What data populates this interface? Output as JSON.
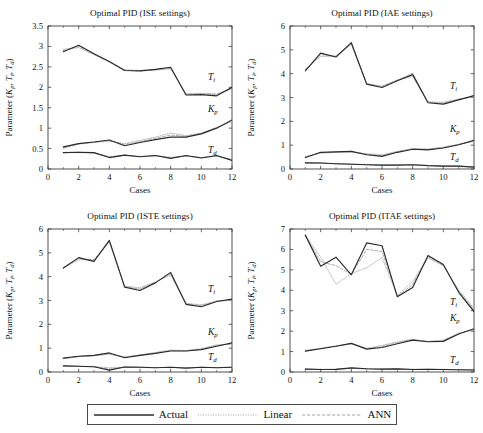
{
  "figure": {
    "legend": {
      "entries": [
        {
          "label": "Actual",
          "style": "solid",
          "color": "#2b2b2b"
        },
        {
          "label": "Linear",
          "style": "dotted",
          "color": "#9a9a9a"
        },
        {
          "label": "ANN",
          "style": "dashed",
          "color": "#9a9a9a"
        }
      ]
    },
    "axis_label_x": "Cases",
    "axis_label_y": "Parameter (Kₚ, Tᵢ, T_d)",
    "curve_labels": {
      "ti": "T",
      "ti_sub": "i",
      "kp": "K",
      "kp_sub": "p",
      "td": "T",
      "td_sub": "d"
    }
  },
  "chart_data": [
    {
      "id": "ise",
      "type": "line",
      "title": "Optimal PID (ISE settings)",
      "xlabel": "Cases",
      "ylabel": "Parameter (Kp, Ti, Td)",
      "x": [
        1,
        2,
        3,
        4,
        5,
        6,
        7,
        8,
        9,
        10,
        11,
        12
      ],
      "xlim": [
        0,
        12
      ],
      "ylim": [
        0,
        3.5
      ],
      "xticks": [
        0,
        2,
        4,
        6,
        8,
        10,
        12
      ],
      "yticks": [
        0,
        0.5,
        1,
        1.5,
        2,
        2.5,
        3,
        3.5
      ],
      "grid": false,
      "legend_position": "below-figure",
      "series": [
        {
          "name": "Ti Actual",
          "param": "Ti",
          "model": "Actual",
          "values": [
            2.87,
            3.03,
            2.82,
            2.63,
            2.41,
            2.4,
            2.44,
            2.49,
            1.81,
            1.82,
            1.79,
            2.0
          ]
        },
        {
          "name": "Ti Linear",
          "param": "Ti",
          "model": "Linear",
          "values": [
            2.93,
            2.97,
            2.8,
            2.62,
            2.43,
            2.41,
            2.43,
            2.45,
            1.84,
            1.85,
            1.84,
            1.96
          ]
        },
        {
          "name": "Ti ANN",
          "param": "Ti",
          "model": "ANN",
          "values": [
            2.9,
            3.0,
            2.81,
            2.62,
            2.42,
            2.4,
            2.42,
            2.47,
            1.83,
            1.84,
            1.82,
            1.98
          ]
        },
        {
          "name": "Kp Actual",
          "param": "Kp",
          "model": "Actual",
          "values": [
            0.54,
            0.62,
            0.66,
            0.71,
            0.57,
            0.65,
            0.72,
            0.78,
            0.78,
            0.86,
            1.0,
            1.2
          ]
        },
        {
          "name": "Kp Linear",
          "param": "Kp",
          "model": "Linear",
          "values": [
            0.5,
            0.61,
            0.65,
            0.68,
            0.62,
            0.7,
            0.78,
            0.88,
            0.82,
            0.88,
            1.02,
            1.16
          ]
        },
        {
          "name": "Kp ANN",
          "param": "Kp",
          "model": "ANN",
          "values": [
            0.52,
            0.62,
            0.66,
            0.7,
            0.6,
            0.67,
            0.75,
            0.83,
            0.8,
            0.87,
            1.01,
            1.18
          ]
        },
        {
          "name": "Td Actual",
          "param": "Td",
          "model": "Actual",
          "values": [
            0.4,
            0.41,
            0.4,
            0.28,
            0.34,
            0.3,
            0.33,
            0.26,
            0.33,
            0.27,
            0.33,
            0.21
          ]
        },
        {
          "name": "Td Linear",
          "param": "Td",
          "model": "Linear",
          "values": [
            0.4,
            0.4,
            0.39,
            0.31,
            0.33,
            0.31,
            0.32,
            0.29,
            0.31,
            0.28,
            0.31,
            0.24
          ]
        },
        {
          "name": "Td ANN",
          "param": "Td",
          "model": "ANN",
          "values": [
            0.4,
            0.41,
            0.39,
            0.29,
            0.34,
            0.3,
            0.33,
            0.27,
            0.32,
            0.28,
            0.32,
            0.22
          ]
        }
      ]
    },
    {
      "id": "iae",
      "type": "line",
      "title": "Optimal PID (IAE settings)",
      "xlabel": "Cases",
      "ylabel": "Parameter (Kp, Ti, Td)",
      "x": [
        1,
        2,
        3,
        4,
        5,
        6,
        7,
        8,
        9,
        10,
        11,
        12
      ],
      "xlim": [
        0,
        12
      ],
      "ylim": [
        0,
        6
      ],
      "xticks": [
        0,
        2,
        4,
        6,
        8,
        10,
        12
      ],
      "yticks": [
        0,
        1,
        2,
        3,
        4,
        5,
        6
      ],
      "grid": false,
      "legend_position": "below-figure",
      "series": [
        {
          "name": "Ti Actual",
          "param": "Ti",
          "model": "Actual",
          "values": [
            4.12,
            4.86,
            4.7,
            5.3,
            3.56,
            3.42,
            3.7,
            3.96,
            2.78,
            2.72,
            2.9,
            3.08
          ]
        },
        {
          "name": "Ti Linear",
          "param": "Ti",
          "model": "Linear",
          "values": [
            4.2,
            4.72,
            4.74,
            5.22,
            3.58,
            3.48,
            3.74,
            3.88,
            2.82,
            2.8,
            2.94,
            3.02
          ]
        },
        {
          "name": "Ti ANN",
          "param": "Ti",
          "model": "ANN",
          "values": [
            4.16,
            4.8,
            4.72,
            5.26,
            3.57,
            3.45,
            3.72,
            4.02,
            2.8,
            2.76,
            2.92,
            3.05
          ]
        },
        {
          "name": "Kp Actual",
          "param": "Kp",
          "model": "Actual",
          "values": [
            0.48,
            0.7,
            0.72,
            0.74,
            0.6,
            0.53,
            0.7,
            0.83,
            0.8,
            0.88,
            1.02,
            1.2
          ]
        },
        {
          "name": "Kp Linear",
          "param": "Kp",
          "model": "Linear",
          "values": [
            0.52,
            0.66,
            0.7,
            0.72,
            0.64,
            0.6,
            0.74,
            0.86,
            0.84,
            0.92,
            1.04,
            1.16
          ]
        },
        {
          "name": "Kp ANN",
          "param": "Kp",
          "model": "ANN",
          "values": [
            0.5,
            0.68,
            0.71,
            0.73,
            0.62,
            0.56,
            0.72,
            0.84,
            0.82,
            0.9,
            1.03,
            1.18
          ]
        },
        {
          "name": "Td Actual",
          "param": "Td",
          "model": "Actual",
          "values": [
            0.26,
            0.25,
            0.22,
            0.2,
            0.18,
            0.16,
            0.16,
            0.18,
            0.14,
            0.12,
            0.12,
            0.08
          ]
        },
        {
          "name": "Td Linear",
          "param": "Td",
          "model": "Linear",
          "values": [
            0.26,
            0.24,
            0.23,
            0.21,
            0.19,
            0.17,
            0.17,
            0.17,
            0.15,
            0.13,
            0.12,
            0.09
          ]
        },
        {
          "name": "Td ANN",
          "param": "Td",
          "model": "ANN",
          "values": [
            0.26,
            0.25,
            0.22,
            0.2,
            0.18,
            0.16,
            0.16,
            0.18,
            0.14,
            0.12,
            0.12,
            0.08
          ]
        }
      ]
    },
    {
      "id": "iste",
      "type": "line",
      "title": "Optimal PID (ISTE settings)",
      "xlabel": "Cases",
      "ylabel": "Parameter (Kp, Ti, Td)",
      "x": [
        1,
        2,
        3,
        4,
        5,
        6,
        7,
        8,
        9,
        10,
        11,
        12
      ],
      "xlim": [
        0,
        12
      ],
      "ylim": [
        0,
        6
      ],
      "xticks": [
        0,
        2,
        4,
        6,
        8,
        10,
        12
      ],
      "yticks": [
        0,
        1,
        2,
        3,
        4,
        5,
        6
      ],
      "grid": false,
      "legend_position": "below-figure",
      "series": [
        {
          "name": "Ti Actual",
          "param": "Ti",
          "model": "Actual",
          "values": [
            4.36,
            4.8,
            4.64,
            5.52,
            3.56,
            3.42,
            3.74,
            4.18,
            2.84,
            2.74,
            2.96,
            3.06
          ]
        },
        {
          "name": "Ti Linear",
          "param": "Ti",
          "model": "Linear",
          "values": [
            4.38,
            4.7,
            4.72,
            5.44,
            3.6,
            3.54,
            3.78,
            4.06,
            2.88,
            2.82,
            2.98,
            3.0
          ]
        },
        {
          "name": "Ti ANN",
          "param": "Ti",
          "model": "ANN",
          "values": [
            4.37,
            4.76,
            4.68,
            5.48,
            3.58,
            3.48,
            3.76,
            4.12,
            2.86,
            2.78,
            2.97,
            3.03
          ]
        },
        {
          "name": "Kp Actual",
          "param": "Kp",
          "model": "Actual",
          "values": [
            0.58,
            0.66,
            0.7,
            0.8,
            0.6,
            0.7,
            0.78,
            0.88,
            0.88,
            0.94,
            1.08,
            1.22
          ]
        },
        {
          "name": "Kp Linear",
          "param": "Kp",
          "model": "Linear",
          "values": [
            0.56,
            0.64,
            0.68,
            0.74,
            0.64,
            0.72,
            0.82,
            0.92,
            0.9,
            0.98,
            1.14,
            1.16
          ]
        },
        {
          "name": "Kp ANN",
          "param": "Kp",
          "model": "ANN",
          "values": [
            0.57,
            0.65,
            0.69,
            0.77,
            0.62,
            0.71,
            0.8,
            0.9,
            0.89,
            0.96,
            1.11,
            1.19
          ]
        },
        {
          "name": "Td Actual",
          "param": "Td",
          "model": "Actual",
          "values": [
            0.26,
            0.24,
            0.22,
            0.08,
            0.21,
            0.2,
            0.18,
            0.2,
            0.16,
            0.2,
            0.18,
            0.2
          ]
        },
        {
          "name": "Td Linear",
          "param": "Td",
          "model": "Linear",
          "values": [
            0.25,
            0.23,
            0.22,
            0.18,
            0.2,
            0.2,
            0.19,
            0.19,
            0.18,
            0.19,
            0.19,
            0.2
          ]
        },
        {
          "name": "Td ANN",
          "param": "Td",
          "model": "ANN",
          "values": [
            0.26,
            0.24,
            0.22,
            0.12,
            0.21,
            0.2,
            0.18,
            0.2,
            0.17,
            0.2,
            0.18,
            0.2
          ]
        }
      ]
    },
    {
      "id": "itae",
      "type": "line",
      "title": "Optimal PID (ITAE settings)",
      "xlabel": "Cases",
      "ylabel": "Parameter (Kp, Ti, Td)",
      "x": [
        1,
        2,
        3,
        4,
        5,
        6,
        7,
        8,
        9,
        10,
        11,
        12
      ],
      "xlim": [
        0,
        12
      ],
      "ylim": [
        0,
        7
      ],
      "xticks": [
        0,
        2,
        4,
        6,
        8,
        10,
        12
      ],
      "yticks": [
        0,
        1,
        2,
        3,
        4,
        5,
        6,
        7
      ],
      "grid": false,
      "legend_position": "below-figure",
      "series": [
        {
          "name": "Ti Actual",
          "param": "Ti",
          "model": "Actual",
          "values": [
            6.7,
            5.18,
            5.62,
            4.76,
            6.32,
            6.18,
            3.68,
            4.14,
            5.7,
            5.26,
            3.9,
            2.96
          ]
        },
        {
          "name": "Ti Linear",
          "param": "Ti",
          "model": "Linear",
          "values": [
            6.68,
            5.62,
            4.3,
            4.82,
            5.1,
            5.6,
            3.74,
            4.44,
            5.58,
            5.2,
            4.02,
            3.12
          ]
        },
        {
          "name": "Ti ANN",
          "param": "Ti",
          "model": "ANN",
          "values": [
            6.66,
            5.4,
            5.2,
            4.78,
            6.0,
            5.9,
            3.7,
            4.28,
            5.64,
            5.22,
            3.96,
            3.04
          ]
        },
        {
          "name": "Kp Actual",
          "param": "Kp",
          "model": "Actual",
          "values": [
            1.02,
            1.14,
            1.26,
            1.4,
            1.12,
            1.2,
            1.38,
            1.56,
            1.48,
            1.5,
            1.86,
            2.12
          ]
        },
        {
          "name": "Kp Linear",
          "param": "Kp",
          "model": "Linear",
          "values": [
            1.06,
            1.16,
            1.28,
            1.38,
            1.16,
            1.3,
            1.48,
            1.6,
            1.5,
            1.56,
            1.9,
            2.06
          ]
        },
        {
          "name": "Kp ANN",
          "param": "Kp",
          "model": "ANN",
          "values": [
            1.04,
            1.15,
            1.27,
            1.39,
            1.14,
            1.25,
            1.43,
            1.58,
            1.49,
            1.53,
            1.88,
            2.09
          ]
        },
        {
          "name": "Td Actual",
          "param": "Td",
          "model": "Actual",
          "values": [
            0.14,
            0.12,
            0.13,
            0.2,
            0.16,
            0.14,
            0.15,
            0.12,
            0.13,
            0.12,
            0.11,
            0.1
          ]
        },
        {
          "name": "Td Linear",
          "param": "Td",
          "model": "Linear",
          "values": [
            0.15,
            0.13,
            0.14,
            0.17,
            0.15,
            0.14,
            0.14,
            0.13,
            0.13,
            0.12,
            0.11,
            0.1
          ]
        },
        {
          "name": "Td ANN",
          "param": "Td",
          "model": "ANN",
          "values": [
            0.14,
            0.12,
            0.13,
            0.19,
            0.16,
            0.14,
            0.15,
            0.12,
            0.13,
            0.12,
            0.11,
            0.1
          ]
        }
      ]
    }
  ]
}
